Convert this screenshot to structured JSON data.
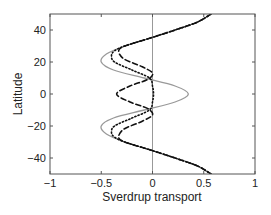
{
  "chart_data": {
    "type": "line",
    "title": "",
    "xlabel": "Sverdrup transport",
    "ylabel": "Latitude",
    "xlim": [
      -1,
      1
    ],
    "ylim": [
      -50,
      50
    ],
    "xticks": [
      -1,
      -0.5,
      0,
      0.5,
      1
    ],
    "xtick_labels": [
      "−1",
      "−0.5",
      "0",
      "0.5",
      "1"
    ],
    "yticks": [
      40,
      20,
      0,
      -20,
      -40
    ],
    "ytick_labels": [
      "40",
      "20",
      "0",
      "−20",
      "−40"
    ],
    "grid": false,
    "legend": null,
    "reference_lines": [
      {
        "orientation": "vertical",
        "x": 0,
        "color": "#999999"
      }
    ],
    "series": [
      {
        "name": "solid-gray",
        "style": "solid",
        "color": "#999999",
        "lat": [
          50,
          45,
          40,
          35,
          30,
          25,
          20,
          15,
          10,
          5,
          0,
          -5,
          -10,
          -15,
          -20,
          -25,
          -30,
          -35,
          -40,
          -45,
          -50
        ],
        "transport": [
          0.57,
          0.44,
          0.22,
          -0.02,
          -0.27,
          -0.45,
          -0.5,
          -0.38,
          -0.08,
          0.22,
          0.35,
          0.22,
          -0.08,
          -0.38,
          -0.5,
          -0.45,
          -0.27,
          -0.02,
          0.22,
          0.44,
          0.57
        ]
      },
      {
        "name": "dotted-black",
        "style": "dotted",
        "color": "#111111",
        "lat": [
          50,
          45,
          40,
          35,
          30,
          27,
          24,
          20,
          15,
          10,
          5,
          0,
          -5,
          -10,
          -15,
          -20,
          -24,
          -27,
          -30,
          -35,
          -40,
          -45,
          -50
        ],
        "transport": [
          0.57,
          0.44,
          0.22,
          -0.02,
          -0.27,
          -0.37,
          -0.4,
          -0.37,
          -0.2,
          -0.03,
          0.0,
          0.01,
          0.0,
          -0.03,
          -0.2,
          -0.37,
          -0.4,
          -0.37,
          -0.27,
          -0.02,
          0.22,
          0.44,
          0.57
        ]
      },
      {
        "name": "dashed-black",
        "style": "dashed",
        "color": "#111111",
        "lat": [
          50,
          45,
          40,
          35,
          30,
          27,
          22,
          17,
          13,
          9,
          5,
          0,
          -5,
          -9,
          -13,
          -17,
          -22,
          -27,
          -30,
          -35,
          -40,
          -45,
          -50
        ],
        "transport": [
          0.57,
          0.44,
          0.22,
          -0.02,
          -0.27,
          -0.33,
          -0.28,
          -0.1,
          0.0,
          -0.05,
          -0.22,
          -0.35,
          -0.22,
          -0.05,
          0.0,
          -0.1,
          -0.28,
          -0.33,
          -0.27,
          -0.02,
          0.22,
          0.44,
          0.57
        ]
      }
    ]
  }
}
